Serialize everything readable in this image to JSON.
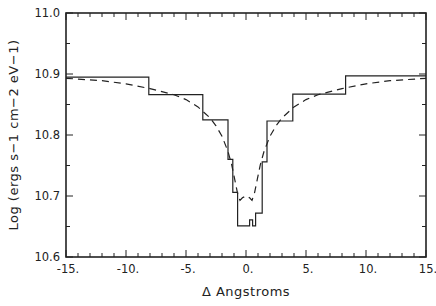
{
  "chart_data": {
    "type": "line",
    "title": "",
    "xlabel": "Δ Angstroms",
    "ylabel": "Log (ergs s−1 cm−2 eV−1)",
    "xlim": [
      -15,
      15
    ],
    "ylim": [
      10.6,
      11.0
    ],
    "grid": false,
    "legend": null,
    "x_ticks": [
      -15,
      -10,
      -5,
      0,
      5,
      10,
      15
    ],
    "x_tick_labels": [
      "-15.",
      "-10.",
      "-5.",
      "0.",
      "5.",
      "10.",
      "15."
    ],
    "y_ticks": [
      10.6,
      10.7,
      10.8,
      10.9,
      11.0
    ],
    "y_tick_labels": [
      "10.6",
      "10.7",
      "10.8",
      "10.9",
      "11.0"
    ],
    "series": [
      {
        "name": "binned profile",
        "style": "solid-step",
        "x": [
          -15,
          -8.1,
          -8.1,
          -3.6,
          -3.6,
          -1.5,
          -1.5,
          -1.1,
          -1.1,
          -0.7,
          -0.7,
          0.3,
          0.3,
          0.55,
          0.55,
          0.8,
          0.8,
          0.95,
          0.95,
          1.35,
          1.35,
          1.75,
          1.75,
          3.9,
          3.9,
          8.3,
          8.3,
          15
        ],
        "y": [
          10.895,
          10.895,
          10.866,
          10.866,
          10.825,
          10.825,
          10.76,
          10.76,
          10.706,
          10.706,
          10.651,
          10.651,
          10.661,
          10.661,
          10.651,
          10.651,
          10.672,
          10.672,
          10.672,
          10.672,
          10.756,
          10.756,
          10.823,
          10.823,
          10.867,
          10.867,
          10.897,
          10.897
        ]
      },
      {
        "name": "model profile",
        "style": "dashed",
        "x": [
          -15,
          -12,
          -10,
          -8,
          -6,
          -5,
          -4,
          -3,
          -2.5,
          -2,
          -1.5,
          -1.2,
          -1,
          -0.7,
          -0.5,
          -0.3,
          0,
          0.3,
          0.5,
          0.7,
          1,
          1.2,
          1.5,
          2,
          2.5,
          3,
          4,
          5,
          6,
          8,
          10,
          12,
          15
        ],
        "y": [
          10.893,
          10.889,
          10.884,
          10.876,
          10.866,
          10.858,
          10.846,
          10.828,
          10.815,
          10.798,
          10.773,
          10.752,
          10.733,
          10.704,
          10.693,
          10.697,
          10.7,
          10.697,
          10.693,
          10.704,
          10.733,
          10.752,
          10.773,
          10.798,
          10.815,
          10.828,
          10.846,
          10.858,
          10.866,
          10.876,
          10.884,
          10.889,
          10.893
        ]
      }
    ]
  }
}
